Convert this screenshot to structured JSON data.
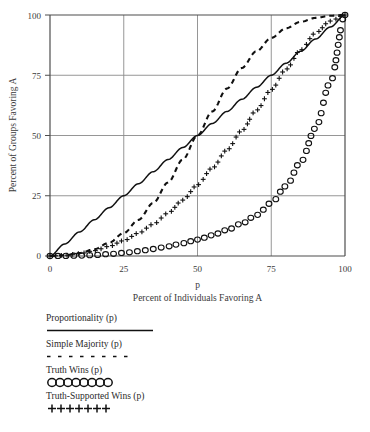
{
  "chart_data": {
    "type": "line",
    "title": "",
    "xlabel": "Percent of Individuals Favoring A",
    "x_variable": "p",
    "ylabel": "Percent of Groups Favoring A",
    "xlim": [
      0,
      100
    ],
    "ylim": [
      0,
      100
    ],
    "xticks": [
      0,
      25,
      50,
      75,
      100
    ],
    "yticks": [
      0,
      25,
      50,
      75,
      100
    ],
    "xtick_labels": [
      "0",
      "25",
      "50",
      "75",
      "100"
    ],
    "ytick_labels": [
      "0",
      "25",
      "50",
      "75",
      "100"
    ],
    "grid": true,
    "legend_position": "below-plot",
    "x": [
      0,
      5,
      10,
      15,
      20,
      25,
      30,
      35,
      40,
      45,
      50,
      55,
      60,
      65,
      70,
      75,
      80,
      85,
      90,
      95,
      100
    ],
    "series": [
      {
        "name": "Proportionality (p)",
        "style": "solid-line",
        "values": [
          0,
          5,
          10,
          15,
          20,
          25,
          30,
          35,
          40,
          45,
          50,
          55,
          60,
          65,
          70,
          75,
          80,
          85,
          90,
          95,
          100
        ]
      },
      {
        "name": "Simple Majority (p)",
        "style": "dashed-line",
        "values": [
          0,
          0.3,
          1.2,
          2.8,
          5.5,
          9.5,
          15,
          22,
          30.5,
          40,
          50,
          60,
          69.5,
          78,
          85,
          90.5,
          94.5,
          97.2,
          98.8,
          99.7,
          100
        ]
      },
      {
        "name": "Truth Wins (p)",
        "style": "circle-markers",
        "values": [
          0,
          0.05,
          0.15,
          0.4,
          0.8,
          1.3,
          2.0,
          2.9,
          4.0,
          5.3,
          6.8,
          8.6,
          10.8,
          13.5,
          17.0,
          22.0,
          29.0,
          39.0,
          53.0,
          72.0,
          100
        ]
      },
      {
        "name": "Truth-Supported Wins (p)",
        "style": "plus-markers",
        "values": [
          0,
          0.3,
          1.0,
          2.2,
          4.0,
          6.4,
          9.5,
          13.2,
          17.8,
          23.2,
          29.5,
          36.5,
          44.0,
          52.0,
          60.5,
          69.0,
          77.5,
          85.5,
          92.5,
          97.5,
          100
        ]
      }
    ]
  },
  "legend": {
    "entries": [
      {
        "label": "Proportionality (p)",
        "sample": "solid-line"
      },
      {
        "label": "Simple Majority (p)",
        "sample": "dashed-line"
      },
      {
        "label": "Truth Wins (p)",
        "sample": "circle-markers"
      },
      {
        "label": "Truth-Supported Wins (p)",
        "sample": "plus-markers"
      }
    ]
  },
  "colors": {
    "axis": "#4d4d4d",
    "grid": "#8a8a8a",
    "curve": "#111111",
    "text": "#2a2a2a",
    "background": "#ffffff"
  }
}
